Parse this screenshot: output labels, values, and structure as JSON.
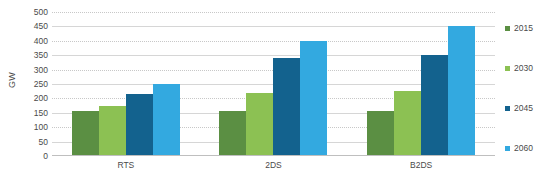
{
  "chart_data": {
    "type": "bar",
    "title": "",
    "xlabel": "",
    "ylabel": "GW",
    "ylim": [
      0,
      500
    ],
    "ytick_step": 50,
    "yticks": [
      0,
      50,
      100,
      150,
      200,
      250,
      300,
      350,
      400,
      450,
      500
    ],
    "grid": true,
    "legend_position": "right",
    "categories": [
      "RTS",
      "2DS",
      "B2DS"
    ],
    "series": [
      {
        "name": "2015",
        "color": "#5b8f43",
        "values": [
          158,
          158,
          157
        ]
      },
      {
        "name": "2030",
        "color": "#8cc153",
        "values": [
          172,
          218,
          227
        ]
      },
      {
        "name": "2045",
        "color": "#13628e",
        "values": [
          215,
          340,
          352
        ]
      },
      {
        "name": "2060",
        "color": "#33a9e0",
        "values": [
          250,
          400,
          450
        ]
      }
    ]
  }
}
